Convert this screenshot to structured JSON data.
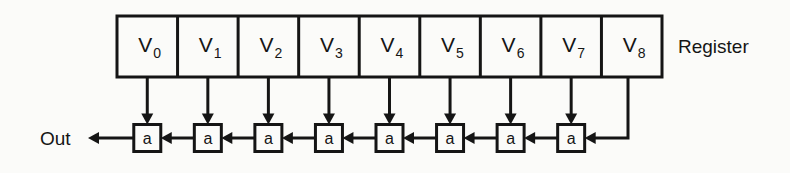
{
  "diagram": {
    "background_color": "#fbfbf9",
    "ink_color": "#151515",
    "register": {
      "label": "Register",
      "cell_symbol": "V",
      "cells": [
        {
          "symbol": "V",
          "subscript": "0"
        },
        {
          "symbol": "V",
          "subscript": "1"
        },
        {
          "symbol": "V",
          "subscript": "2"
        },
        {
          "symbol": "V",
          "subscript": "3"
        },
        {
          "symbol": "V",
          "subscript": "4"
        },
        {
          "symbol": "V",
          "subscript": "5"
        },
        {
          "symbol": "V",
          "subscript": "6"
        },
        {
          "symbol": "V",
          "subscript": "7"
        },
        {
          "symbol": "V",
          "subscript": "8"
        }
      ]
    },
    "nodes": {
      "label": "a",
      "count": 8,
      "labels": [
        "a",
        "a",
        "a",
        "a",
        "a",
        "a",
        "a",
        "a"
      ]
    },
    "output": {
      "label": "Out"
    },
    "geometry": {
      "register_left": 117,
      "register_right": 662,
      "register_top": 16,
      "register_bottom": 77,
      "cell_width": 60.5,
      "node_row_center": 138,
      "node_size": 27,
      "feedback_x": 628,
      "out_arrow_tip_x": 88,
      "register_label_x": 678,
      "register_label_y": 53,
      "out_label_x": 40,
      "out_label_y": 145
    }
  }
}
